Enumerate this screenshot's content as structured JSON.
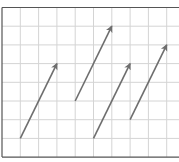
{
  "diagram": {
    "type": "vector-grid",
    "grid": {
      "x0": 2,
      "y0": 7.5,
      "cell_w": 18.3,
      "cell_h": 18.7,
      "cols": 10,
      "rows": 8,
      "line_color": "#d4d4d4",
      "frame_color": "#555555",
      "background": "#ffffff"
    },
    "arrow_color": "#6e6e6e",
    "arrows": [
      {
        "id": "arrow-1",
        "tail": [
          1,
          7
        ],
        "head": [
          3,
          3
        ]
      },
      {
        "id": "arrow-2",
        "tail": [
          4,
          5
        ],
        "head": [
          6,
          1
        ]
      },
      {
        "id": "arrow-3",
        "tail": [
          5,
          7
        ],
        "head": [
          7,
          3
        ]
      },
      {
        "id": "arrow-4",
        "tail": [
          7,
          6
        ],
        "head": [
          9,
          2
        ]
      }
    ]
  },
  "chart_data": {
    "type": "vector-diagram",
    "title": "",
    "grid_units": {
      "cols": 10,
      "rows": 8
    },
    "vectors": [
      {
        "name": "vector 1",
        "from": [
          1,
          1
        ],
        "to": [
          3,
          5
        ],
        "dx": 2,
        "dy": 4
      },
      {
        "name": "vector 2",
        "from": [
          4,
          3
        ],
        "to": [
          6,
          7
        ],
        "dx": 2,
        "dy": 4
      },
      {
        "name": "vector 3",
        "from": [
          5,
          1
        ],
        "to": [
          7,
          5
        ],
        "dx": 2,
        "dy": 4
      },
      {
        "name": "vector 4",
        "from": [
          7,
          2
        ],
        "to": [
          9,
          6
        ],
        "dx": 2,
        "dy": 4
      }
    ]
  }
}
